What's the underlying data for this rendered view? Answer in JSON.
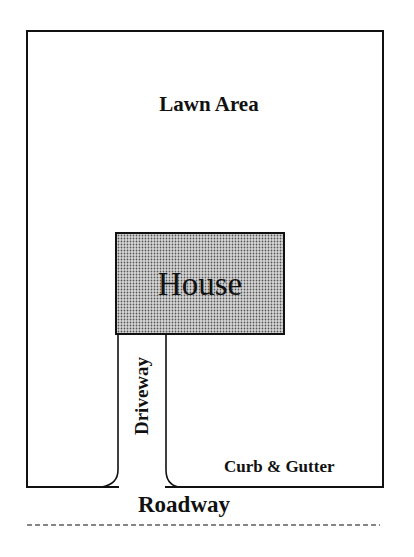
{
  "diagram": {
    "type": "site-plan",
    "labels": {
      "lawn": "Lawn Area",
      "house": "House",
      "driveway": "Driveway",
      "curb": "Curb & Gutter",
      "roadway": "Roadway"
    },
    "colors": {
      "line": "#111111",
      "house_fill": "#b8b8b8",
      "background": "#ffffff"
    }
  }
}
